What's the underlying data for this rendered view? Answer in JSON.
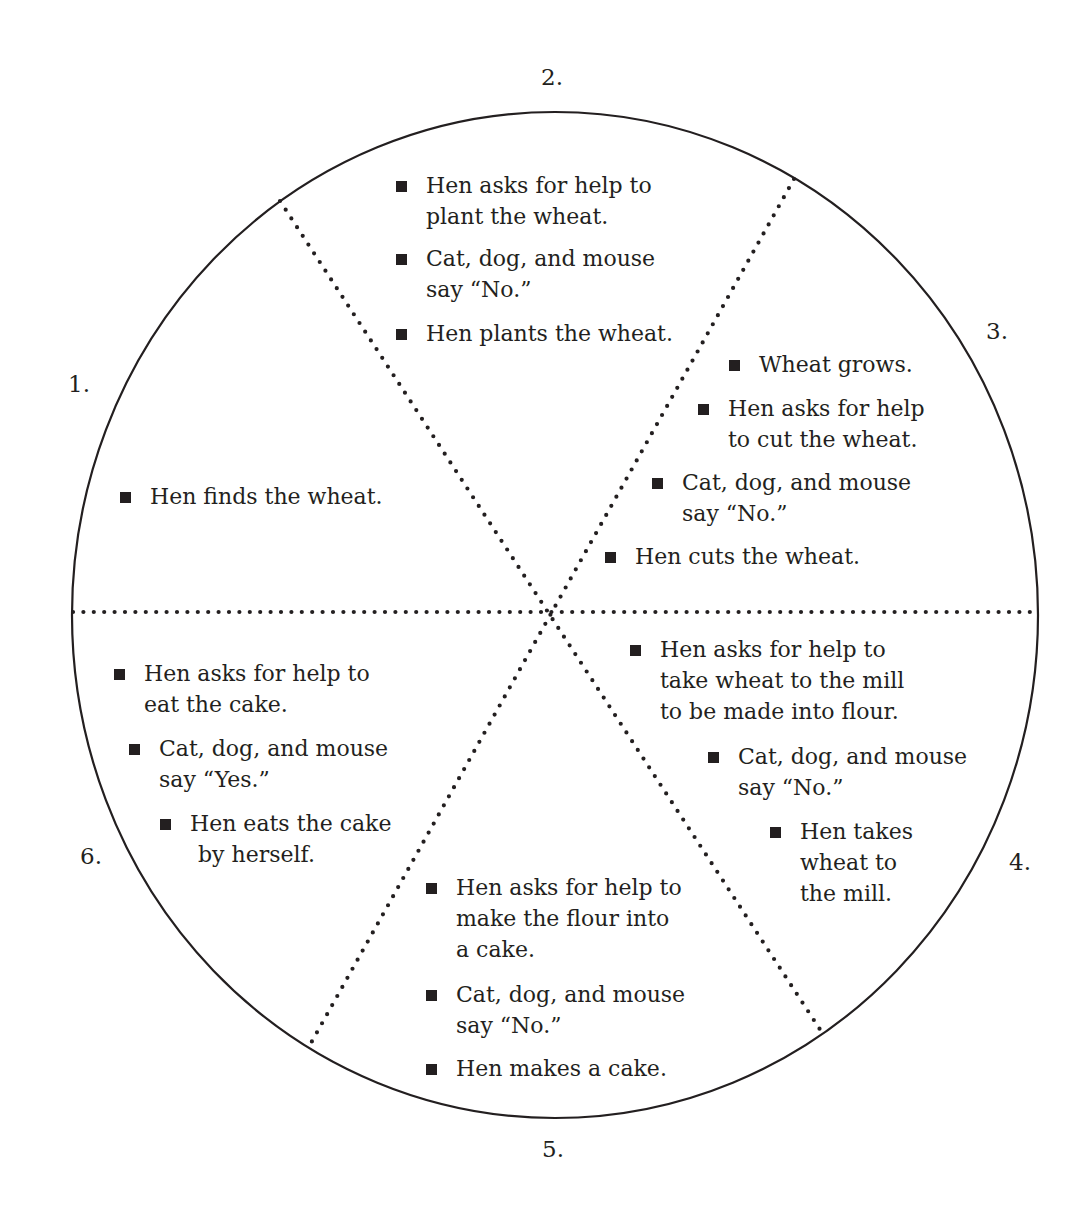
{
  "diagram": {
    "type": "story-wheel",
    "center": [
      553,
      613
    ],
    "colors": {
      "ink": "#231f20",
      "background": "#ffffff"
    }
  },
  "sections": [
    {
      "number": "1.",
      "events": [
        "Hen finds the wheat."
      ]
    },
    {
      "number": "2.",
      "events": [
        "Hen asks for help to plant the wheat.",
        "Cat, dog, and mouse say “No.”",
        "Hen plants the wheat."
      ]
    },
    {
      "number": "3.",
      "events": [
        "Wheat grows.",
        "Hen asks for help to cut the wheat.",
        "Cat, dog, and mouse say “No.”",
        "Hen cuts the wheat."
      ]
    },
    {
      "number": "4.",
      "events": [
        "Hen asks for help to take wheat to the mill to be made into flour.",
        "Cat, dog, and mouse say “No.”",
        "Hen takes wheat to the mill."
      ]
    },
    {
      "number": "5.",
      "events": [
        "Hen asks for help to make the flour into a cake.",
        "Cat, dog, and mouse say “No.”",
        "Hen makes a cake."
      ]
    },
    {
      "number": "6.",
      "events": [
        "Hen asks for help to eat the cake.",
        "Cat, dog, and mouse say “Yes.”",
        "Hen eats the cake by herself."
      ]
    }
  ],
  "lines": {
    "s1": [
      "Hen finds the wheat."
    ],
    "s2": [
      [
        "Hen asks for help to",
        "plant the wheat."
      ],
      [
        "Cat, dog, and mouse",
        "say “No.”"
      ],
      [
        "Hen plants the wheat."
      ]
    ],
    "s3": [
      [
        "Wheat grows."
      ],
      [
        "Hen asks for help",
        "to cut the wheat."
      ],
      [
        "Cat, dog, and mouse",
        "say “No.”"
      ],
      [
        "Hen cuts the wheat."
      ]
    ],
    "s4": [
      [
        "Hen asks for help to",
        "take wheat to the mill",
        "to be made into flour."
      ],
      [
        "Cat, dog, and mouse",
        "say “No.”"
      ],
      [
        "Hen takes",
        "wheat to",
        "the mill."
      ]
    ],
    "s5": [
      [
        "Hen asks for help to",
        "make the flour into",
        "a cake."
      ],
      [
        "Cat, dog, and mouse",
        "say “No.”"
      ],
      [
        "Hen makes a cake."
      ]
    ],
    "s6": [
      [
        "Hen asks for help to",
        "eat the cake."
      ],
      [
        "Cat, dog, and mouse",
        "say “Yes.”"
      ],
      [
        "Hen eats the cake",
        "by herself."
      ]
    ]
  }
}
